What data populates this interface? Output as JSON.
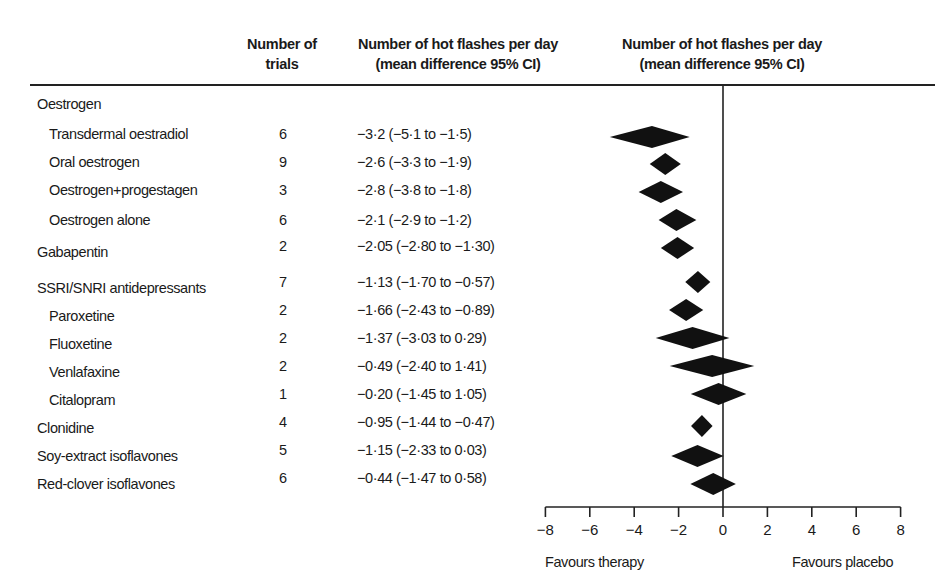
{
  "header": {
    "trials_line1": "Number of",
    "trials_line2": "trials",
    "ci_line1": "Number of hot flashes per day",
    "ci_line2": "(mean difference 95% CI)",
    "plot_line1": "Number of hot flashes per day",
    "plot_line2": "(mean difference 95% CI)"
  },
  "rows": [
    {
      "label": "Oestrogen",
      "indent": false,
      "trials": "",
      "ci": ""
    },
    {
      "label": "Transdermal oestradiol",
      "indent": true,
      "trials": "6",
      "ci": "−3·2 (−5·1 to −1·5)"
    },
    {
      "label": "Oral oestrogen",
      "indent": true,
      "trials": "9",
      "ci": "−2·6 (−3·3 to −1·9)"
    },
    {
      "label": "Oestrogen+progestagen",
      "indent": true,
      "trials": "3",
      "ci": "−2·8 (−3·8 to −1·8)"
    },
    {
      "label": "Oestrogen alone",
      "indent": true,
      "trials": "6",
      "ci": "−2·1 (−2·9 to −1·2)"
    },
    {
      "label": "Gabapentin",
      "indent": false,
      "trials": "2",
      "ci": "−2·05 (−2·80 to −1·30)"
    },
    {
      "label": "SSRI/SNRI antidepressants",
      "indent": false,
      "trials": "7",
      "ci": "−1·13 (−1·70 to −0·57)"
    },
    {
      "label": "Paroxetine",
      "indent": true,
      "trials": "2",
      "ci": "−1·66 (−2·43 to −0·89)"
    },
    {
      "label": "Fluoxetine",
      "indent": true,
      "trials": "2",
      "ci": "−1·37 (−3·03 to 0·29)"
    },
    {
      "label": "Venlafaxine",
      "indent": true,
      "trials": "2",
      "ci": "−0·49 (−2·40 to 1·41)"
    },
    {
      "label": "Citalopram",
      "indent": true,
      "trials": "1",
      "ci": "−0·20 (−1·45 to 1·05)"
    },
    {
      "label": "Clonidine",
      "indent": false,
      "trials": "4",
      "ci": "−0·95 (−1·44 to −0·47)"
    },
    {
      "label": "Soy-extract isoflavones",
      "indent": false,
      "trials": "5",
      "ci": "−1·15 (−2·33 to 0·03)"
    },
    {
      "label": "Red-clover isoflavones",
      "indent": false,
      "trials": "6",
      "ci": "−0·44 (−1·47 to 0·58)"
    }
  ],
  "axis": {
    "ticks": [
      "−8",
      "−6",
      "−4",
      "−2",
      "0",
      "2",
      "4",
      "6",
      "8"
    ],
    "favours_left": "Favours therapy",
    "favours_right": "Favours placebo"
  },
  "colors": {
    "marker": "#111111",
    "axis": "#222222"
  },
  "chart_data": {
    "type": "forest",
    "title": "",
    "xlabel": "Number of hot flashes per day (mean difference 95% CI)",
    "xlim": [
      -8,
      8
    ],
    "xticks": [
      -8,
      -6,
      -4,
      -2,
      0,
      2,
      4,
      6,
      8
    ],
    "reference_line": 0,
    "annotations": [
      "Favours therapy",
      "Favours placebo"
    ],
    "columns": [
      "Number of trials",
      "Number of hot flashes per day (mean difference 95% CI)"
    ],
    "studies": [
      {
        "name": "Oestrogen",
        "group_header": true
      },
      {
        "name": "Transdermal oestradiol",
        "trials": 6,
        "mean": -3.2,
        "lower": -5.1,
        "upper": -1.5
      },
      {
        "name": "Oral oestrogen",
        "trials": 9,
        "mean": -2.6,
        "lower": -3.3,
        "upper": -1.9
      },
      {
        "name": "Oestrogen+progestagen",
        "trials": 3,
        "mean": -2.8,
        "lower": -3.8,
        "upper": -1.8
      },
      {
        "name": "Oestrogen alone",
        "trials": 6,
        "mean": -2.1,
        "lower": -2.9,
        "upper": -1.2
      },
      {
        "name": "Gabapentin",
        "trials": 2,
        "mean": -2.05,
        "lower": -2.8,
        "upper": -1.3
      },
      {
        "name": "SSRI/SNRI antidepressants",
        "trials": 7,
        "mean": -1.13,
        "lower": -1.7,
        "upper": -0.57
      },
      {
        "name": "Paroxetine",
        "trials": 2,
        "mean": -1.66,
        "lower": -2.43,
        "upper": -0.89
      },
      {
        "name": "Fluoxetine",
        "trials": 2,
        "mean": -1.37,
        "lower": -3.03,
        "upper": 0.29
      },
      {
        "name": "Venlafaxine",
        "trials": 2,
        "mean": -0.49,
        "lower": -2.4,
        "upper": 1.41
      },
      {
        "name": "Citalopram",
        "trials": 1,
        "mean": -0.2,
        "lower": -1.45,
        "upper": 1.05
      },
      {
        "name": "Clonidine",
        "trials": 4,
        "mean": -0.95,
        "lower": -1.44,
        "upper": -0.47
      },
      {
        "name": "Soy-extract isoflavones",
        "trials": 5,
        "mean": -1.15,
        "lower": -2.33,
        "upper": 0.03
      },
      {
        "name": "Red-clover isoflavones",
        "trials": 6,
        "mean": -0.44,
        "lower": -1.47,
        "upper": 0.58
      }
    ]
  }
}
